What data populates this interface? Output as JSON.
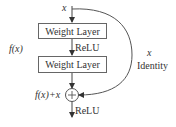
{
  "diagram": {
    "input_label": "x",
    "layers": [
      {
        "label": "Weight Layer"
      },
      {
        "label": "Weight Layer"
      }
    ],
    "activation_mid": "ReLU",
    "activation_out": "ReLU",
    "function_label": "f(x)",
    "sum_label": "f(x)+x",
    "sum_symbol": "+",
    "shortcut": {
      "var_label": "x",
      "name_label": "Identity"
    },
    "colors": {
      "stroke": "#555555",
      "text": "#333333",
      "background": "#ffffff"
    }
  }
}
